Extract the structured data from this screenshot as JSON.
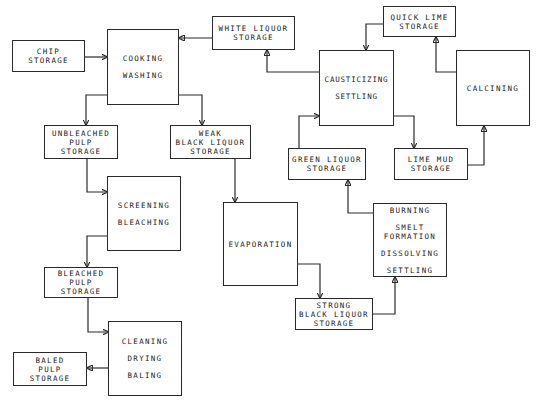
{
  "diagram": {
    "nodes": {
      "chip_storage": [
        "CHIP",
        "STORAGE"
      ],
      "cooking_washing": [
        "COOKING",
        "WASHING"
      ],
      "white_liquor_storage": [
        "WHITE LIQUOR",
        "STORAGE"
      ],
      "quick_lime_storage": [
        "QUICK LIME",
        "STORAGE"
      ],
      "causticizing_settling": [
        "CAUSTICIZING",
        "SETTLING"
      ],
      "calcining": [
        "CALCINING"
      ],
      "unbleached_pulp_storage": [
        "UNBLEACHED",
        "PULP",
        "STORAGE"
      ],
      "weak_black_liquor_storage": [
        "WEAK",
        "BLACK LIQUOR",
        "STORAGE"
      ],
      "green_liquor_storage": [
        "GREEN LIQUOR",
        "STORAGE"
      ],
      "lime_mud_storage": [
        "LIME MUD",
        "STORAGE"
      ],
      "screening_bleaching": [
        "SCREENING",
        "BLEACHING"
      ],
      "evaporation": [
        "EVAPORATION"
      ],
      "recovery_furnace": [
        "BURNING",
        "SMELT",
        "FORMATION",
        "DISSOLVING",
        "SETTLING"
      ],
      "bleached_pulp_storage": [
        "BLEACHED",
        "PULP",
        "STORAGE"
      ],
      "strong_black_liquor_storage": [
        "STRONG",
        "BLACK LIQUOR",
        "STORAGE"
      ],
      "cleaning_drying_baling": [
        "CLEANING",
        "DRYING",
        "BALING"
      ],
      "baled_pulp_storage": [
        "BALED",
        "PULP",
        "STORAGE"
      ]
    },
    "edges": [
      {
        "from": "chip_storage",
        "to": "cooking_washing"
      },
      {
        "from": "white_liquor_storage",
        "to": "cooking_washing"
      },
      {
        "from": "cooking_washing",
        "to": "unbleached_pulp_storage"
      },
      {
        "from": "cooking_washing",
        "to": "weak_black_liquor_storage"
      },
      {
        "from": "unbleached_pulp_storage",
        "to": "screening_bleaching"
      },
      {
        "from": "screening_bleaching",
        "to": "bleached_pulp_storage"
      },
      {
        "from": "bleached_pulp_storage",
        "to": "cleaning_drying_baling"
      },
      {
        "from": "cleaning_drying_baling",
        "to": "baled_pulp_storage"
      },
      {
        "from": "weak_black_liquor_storage",
        "to": "evaporation"
      },
      {
        "from": "evaporation",
        "to": "strong_black_liquor_storage"
      },
      {
        "from": "strong_black_liquor_storage",
        "to": "recovery_furnace"
      },
      {
        "from": "recovery_furnace",
        "to": "green_liquor_storage"
      },
      {
        "from": "green_liquor_storage",
        "to": "causticizing_settling"
      },
      {
        "from": "causticizing_settling",
        "to": "white_liquor_storage"
      },
      {
        "from": "quick_lime_storage",
        "to": "causticizing_settling"
      },
      {
        "from": "causticizing_settling",
        "to": "lime_mud_storage"
      },
      {
        "from": "lime_mud_storage",
        "to": "calcining"
      },
      {
        "from": "calcining",
        "to": "quick_lime_storage"
      }
    ]
  }
}
